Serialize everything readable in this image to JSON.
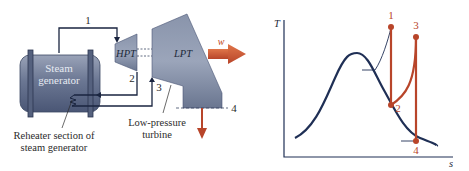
{
  "schematic": {
    "steam_generator_label": [
      "Steam",
      "generator"
    ],
    "reheater_label": [
      "Reheater section of",
      "steam generator"
    ],
    "hpt_label": "HPT",
    "lpt_label": "LPT",
    "lpt_caption": [
      "Low-pressure",
      "turbine"
    ],
    "work_label": "w",
    "state_labels": {
      "s1": "1",
      "s2": "2",
      "s3": "3",
      "s4": "4"
    }
  },
  "ts_diagram": {
    "y_axis_label": "T",
    "x_axis_label": "s",
    "state_labels": {
      "s1": "1",
      "s2": "2",
      "s3": "3",
      "s4": "4"
    }
  },
  "colors": {
    "process_line": "#b8452a",
    "dome_curve": "#1f2f55",
    "pipe": "#1a2540",
    "machine_fill": "#7a869e",
    "work_arrow": "#d0552a"
  }
}
